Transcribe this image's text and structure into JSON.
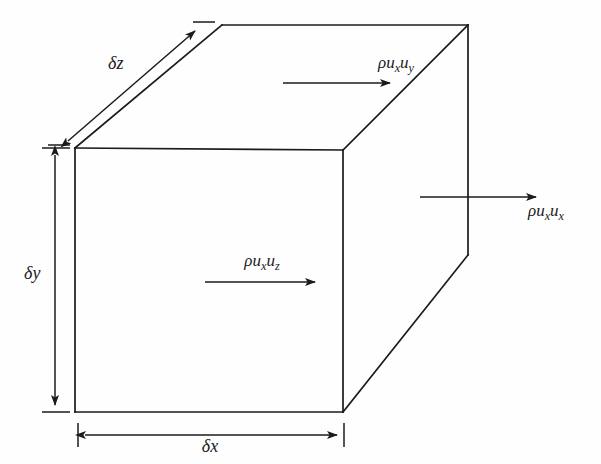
{
  "figure": {
    "kind": "control-volume-cuboid",
    "stroke_color": "#1b1b1b",
    "background_color": "#fefefe",
    "labels": {
      "flux_top": {
        "rho": "ρ",
        "u1": "u",
        "sub1": "x",
        "u2": "u",
        "sub2": "y",
        "text": "ρuₓuᵧ"
      },
      "flux_front": {
        "rho": "ρ",
        "u1": "u",
        "sub1": "x",
        "u2": "u",
        "sub2": "z",
        "text": "ρuₓu_z"
      },
      "flux_right": {
        "rho": "ρ",
        "u1": "u",
        "sub1": "x",
        "u2": "u",
        "sub2": "x",
        "text": "ρuₓuₓ"
      },
      "dim_z": {
        "delta": "δ",
        "axis": "z",
        "text": "δz"
      },
      "dim_y": {
        "delta": "δ",
        "axis": "y",
        "text": "δy"
      },
      "dim_x": {
        "delta": "δ",
        "axis": "x",
        "text": "δx"
      }
    },
    "geometry": {
      "front_face": {
        "top_left": [
          75,
          148
        ],
        "top_right": [
          343,
          150
        ],
        "bottom_right": [
          343,
          412
        ],
        "bottom_left": [
          75,
          412
        ]
      },
      "rear_face": {
        "top_left": [
          222,
          25
        ],
        "top_right": [
          468,
          25
        ],
        "bottom_right": [
          468,
          255
        ]
      },
      "depth_offset": [
        147,
        -123
      ]
    },
    "arrows": {
      "flux_top": {
        "from": [
          283,
          83
        ],
        "to": [
          397,
          83
        ],
        "heads": "end"
      },
      "flux_front": {
        "from": [
          205,
          282
        ],
        "to": [
          322,
          282
        ],
        "heads": "end"
      },
      "flux_right": {
        "from": [
          420,
          197
        ],
        "to": [
          543,
          197
        ],
        "heads": "end"
      },
      "dim_z": {
        "from": [
          63,
          145
        ],
        "to": [
          200,
          26
        ],
        "heads": "both"
      },
      "dim_y": {
        "from": [
          55,
          148
        ],
        "to": [
          55,
          412
        ],
        "heads": "both"
      },
      "dim_x": {
        "from": [
          78,
          435
        ],
        "to": [
          344,
          435
        ],
        "heads": "both"
      }
    }
  }
}
